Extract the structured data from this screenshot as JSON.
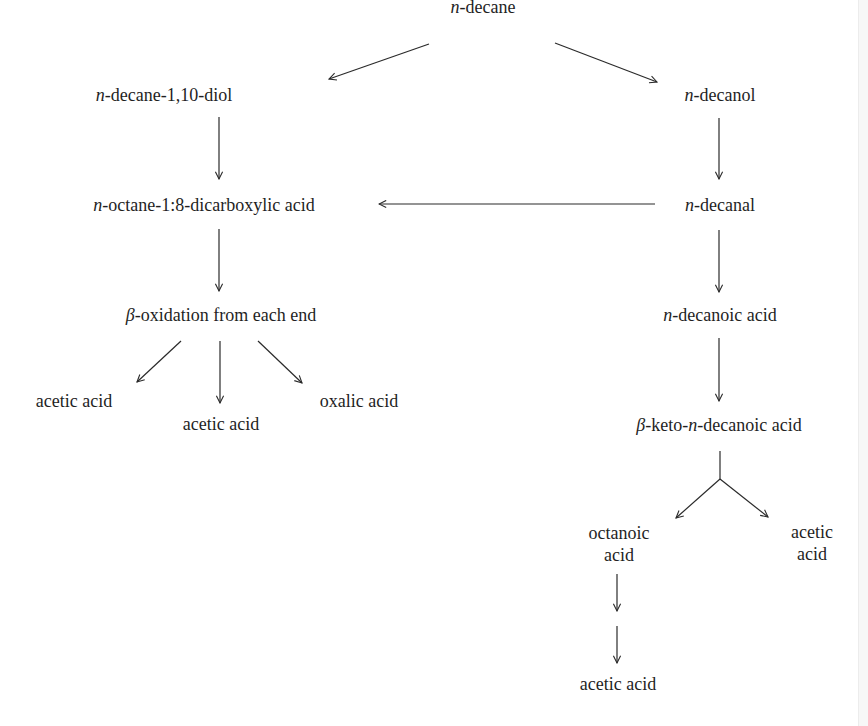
{
  "diagram": {
    "type": "metabolic-pathway",
    "colors": {
      "text": "#1f1f1f",
      "arrow": "#2a2a2a",
      "background": "#ffffff"
    },
    "nodes": {
      "n_decane": {
        "prefix": "n",
        "rest": "-decane"
      },
      "n_decane_diol": {
        "prefix": "n",
        "rest": "-decane-1,10-diol"
      },
      "n_decanol": {
        "prefix": "n",
        "rest": "-decanol"
      },
      "n_octane_dicarboxylic": {
        "prefix": "n",
        "rest": "-octane-1:8-dicarboxylic acid"
      },
      "n_decanal": {
        "prefix": "n",
        "rest": "-decanal"
      },
      "beta_oxidation": {
        "prefix": "β",
        "rest": "-oxidation from each end"
      },
      "n_decanoic_acid": {
        "prefix": "n",
        "rest": "-decanoic acid"
      },
      "acetic_acid_left": {
        "label": "acetic acid"
      },
      "acetic_acid_middle": {
        "label": "acetic acid"
      },
      "oxalic_acid": {
        "label": "oxalic acid"
      },
      "beta_keto": {
        "prefix": "β",
        "mid": "-keto-",
        "prefix2": "n",
        "rest": "-decanoic acid"
      },
      "octanoic_acid": {
        "line1": "octanoic",
        "line2": "acid"
      },
      "acetic_acid_right": {
        "line1": "acetic",
        "line2": "acid"
      },
      "acetic_acid_bottom": {
        "label": "acetic acid"
      }
    },
    "edges": [
      {
        "from": "n-decane",
        "to": "n-decane-1,10-diol"
      },
      {
        "from": "n-decane",
        "to": "n-decanol"
      },
      {
        "from": "n-decane-1,10-diol",
        "to": "n-octane-1:8-dicarboxylic acid"
      },
      {
        "from": "n-decanol",
        "to": "n-decanal"
      },
      {
        "from": "n-decanal",
        "to": "n-octane-1:8-dicarboxylic acid"
      },
      {
        "from": "n-octane-1:8-dicarboxylic acid",
        "to": "β-oxidation from each end"
      },
      {
        "from": "n-decanal",
        "to": "n-decanoic acid"
      },
      {
        "from": "β-oxidation from each end",
        "to": "acetic acid"
      },
      {
        "from": "β-oxidation from each end",
        "to": "acetic acid"
      },
      {
        "from": "β-oxidation from each end",
        "to": "oxalic acid"
      },
      {
        "from": "n-decanoic acid",
        "to": "β-keto-n-decanoic acid"
      },
      {
        "from": "β-keto-n-decanoic acid",
        "to": "octanoic acid"
      },
      {
        "from": "β-keto-n-decanoic acid",
        "to": "acetic acid"
      },
      {
        "from": "octanoic acid",
        "to": "(intermediate)"
      },
      {
        "from": "(intermediate)",
        "to": "acetic acid"
      }
    ]
  }
}
